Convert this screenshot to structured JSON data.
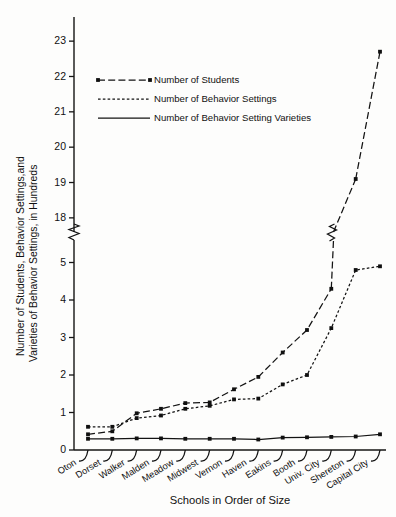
{
  "chart_data": {
    "type": "line",
    "title": "",
    "xlabel": "Schools in Order of Size",
    "ylabel": "Number of Students, Behavior Settings,and Varieties of Behavior Settings, in Hundreds",
    "ylabel_line1": "Number of Students, Behavior Settings,and",
    "ylabel_line2": "Varieties of Behavior Settings, in Hundreds",
    "categories": [
      "Oton",
      "Dorset",
      "Walker",
      "Malden",
      "Meadow",
      "Midwest",
      "Vernon",
      "Haven",
      "Eakins",
      "Booth",
      "Univ. City",
      "Shereton",
      "Capital City"
    ],
    "yticks": [
      0,
      1,
      2,
      3,
      4,
      5,
      18,
      19,
      20,
      21,
      22,
      23
    ],
    "ytick_labels": [
      "0",
      "1",
      "2",
      "3",
      "4",
      "5",
      "18",
      "19",
      "20",
      "21",
      "22",
      "23"
    ],
    "ylim": [
      0,
      23.4
    ],
    "axis_break": {
      "low": 5.6,
      "high": 17.6,
      "label": "axis-break-between-5-and-18"
    },
    "grid": false,
    "legend_position": "top-center",
    "series": [
      {
        "name": "Number of Students",
        "style": "dash-dot",
        "marker": "square",
        "values": [
          0.42,
          0.5,
          0.98,
          1.1,
          1.25,
          1.27,
          1.62,
          1.95,
          2.6,
          3.2,
          4.3,
          19.1,
          22.7
        ]
      },
      {
        "name": "Number of Behavior Settings",
        "style": "dotted",
        "marker": "square",
        "values": [
          0.62,
          0.62,
          0.85,
          0.92,
          1.1,
          1.18,
          1.35,
          1.37,
          1.75,
          2.0,
          3.25,
          4.8,
          4.9
        ]
      },
      {
        "name": "Number of Behavior Setting Varieties",
        "style": "solid",
        "marker": "square",
        "values": [
          0.3,
          0.3,
          0.31,
          0.31,
          0.3,
          0.3,
          0.3,
          0.28,
          0.33,
          0.34,
          0.35,
          0.36,
          0.42
        ]
      }
    ]
  },
  "legend": {
    "items": [
      {
        "label": "Number of Students",
        "style": "dash-dot"
      },
      {
        "label": "Number of Behavior Settings",
        "style": "dotted"
      },
      {
        "label": "Number of Behavior Setting Varieties",
        "style": "solid"
      }
    ]
  },
  "colors": {
    "ink": "#131313",
    "background": "#fdfdfc"
  }
}
